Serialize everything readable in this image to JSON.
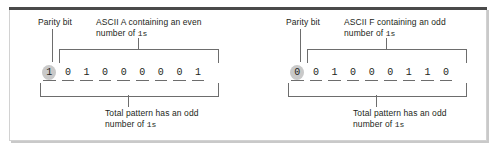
{
  "figure": {
    "kind": "parity-bit-diagram",
    "frame_color": "#4a4a4a",
    "panels": [
      {
        "id": "left",
        "parity_label": "Parity bit",
        "top_caption_line1": "ASCII A containing an even",
        "top_caption_line2_prefix": "number of ",
        "top_caption_line2_mono": "1s",
        "bottom_caption_line1": "Total pattern has an odd",
        "bottom_caption_line2_prefix": "number of ",
        "bottom_caption_line2_mono": "1s",
        "bits": [
          "1",
          "0",
          "1",
          "0",
          "0",
          "0",
          "0",
          "0",
          "1"
        ],
        "parity_bit_value": "1",
        "parity_bit_index": 0
      },
      {
        "id": "right",
        "parity_label": "Parity bit",
        "top_caption_line1": "ASCII F containing an odd",
        "top_caption_line2_prefix": "number of ",
        "top_caption_line2_mono": "1s",
        "bottom_caption_line1": "Total pattern has an odd",
        "bottom_caption_line2_prefix": "number of ",
        "bottom_caption_line2_mono": "1s",
        "bits": [
          "0",
          "0",
          "1",
          "0",
          "0",
          "0",
          "1",
          "1",
          "0"
        ],
        "parity_bit_value": "0",
        "parity_bit_index": 0
      }
    ]
  }
}
